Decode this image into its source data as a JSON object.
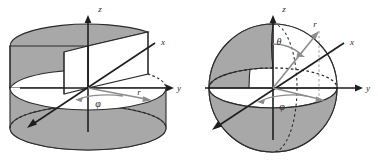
{
  "figure": {
    "background_color": "#ffffff",
    "width": 378,
    "height": 168,
    "panel_count": 2
  },
  "style": {
    "solid_fill": "#a8a8a8",
    "solid_fill_dark": "#999999",
    "solid_fill_light": "#b4b4b4",
    "stroke_color": "#2b2b2b",
    "axis_color": "#1e1e1e",
    "vector_color": "#8c8c8c",
    "dashed_color": "#2b2b2b",
    "guide_color": "#9a9a9a",
    "label_color": "#2b2b2b"
  },
  "panels": [
    {
      "id": "cylindrical",
      "name": "cylindrical-coordinates-diagram",
      "shape": "cylinder-with-wedge-cut",
      "axes": [
        {
          "name": "z",
          "label": "z",
          "direction": "up",
          "label_x": 100,
          "label_y": 12
        },
        {
          "name": "y",
          "label": "y",
          "direction": "right",
          "label_x": 176,
          "label_y": 90
        },
        {
          "name": "x",
          "label": "x",
          "direction": "front-left",
          "label_x": 163,
          "label_y": 45
        }
      ],
      "angles": [
        {
          "name": "phi",
          "label": "φ",
          "plane": "equatorial",
          "label_x": 98,
          "label_y": 104
        }
      ],
      "vectors": [
        {
          "name": "r",
          "label": "r",
          "from": "origin",
          "to": "cylinder-rim",
          "label_x": 139,
          "label_y": 95
        }
      ],
      "origin": {
        "x": 88,
        "y": 88
      }
    },
    {
      "id": "spherical",
      "name": "spherical-coordinates-diagram",
      "shape": "sphere-with-octant-cut",
      "axes": [
        {
          "name": "z",
          "label": "z",
          "direction": "up",
          "label_x": 95,
          "label_y": 12
        },
        {
          "name": "y",
          "label": "y",
          "direction": "right",
          "label_x": 176,
          "label_y": 90
        },
        {
          "name": "x",
          "label": "x",
          "direction": "front-left",
          "label_x": 163,
          "label_y": 45
        }
      ],
      "angles": [
        {
          "name": "theta",
          "label": "θ",
          "plane": "polar",
          "label_x": 90,
          "label_y": 42
        },
        {
          "name": "phi",
          "label": "φ",
          "plane": "equatorial",
          "label_x": 93,
          "label_y": 107
        }
      ],
      "vectors": [
        {
          "name": "r",
          "label": "r",
          "from": "origin",
          "to": "sphere-surface",
          "label_x": 124,
          "label_y": 28
        }
      ],
      "origin": {
        "x": 84,
        "y": 88
      }
    }
  ]
}
